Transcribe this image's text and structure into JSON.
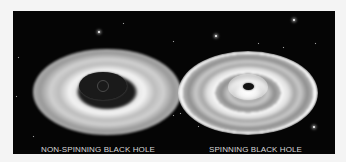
{
  "figure": {
    "background_color": "#050505",
    "captions": [
      {
        "label": "NON-SPINNING BLACK HOLE"
      },
      {
        "label": "SPINNING BLACK HOLE"
      }
    ],
    "panels": [
      {
        "name": "non-spinning-black-hole",
        "description": "Accretion disk with large dark central shadow"
      },
      {
        "name": "spinning-black-hole",
        "description": "Accretion disk with small dark central shadow"
      }
    ]
  }
}
